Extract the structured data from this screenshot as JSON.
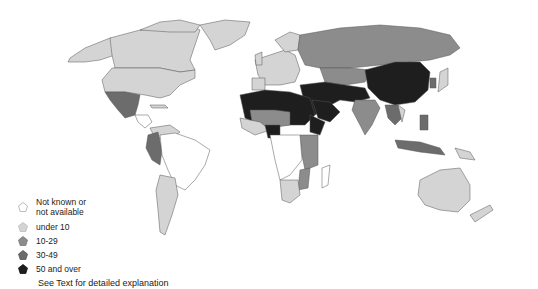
{
  "legend": {
    "items": [
      {
        "label_line1": "Not known or",
        "label_line2": "not available",
        "color": "#ffffff",
        "border": "#aaaaaa"
      },
      {
        "label": "under 10",
        "color": "#d4d4d4",
        "border": "#bbbbbb"
      },
      {
        "label": "10-29",
        "color": "#8c8c8c",
        "border": "#777777"
      },
      {
        "label": "30-49",
        "color": "#6c6c6c",
        "border": "#555555"
      },
      {
        "label": "50 and over",
        "color": "#1e1e1e",
        "border": "#111111"
      }
    ]
  },
  "note": "See Text for detailed explanation",
  "colors": {
    "not_available": "#ffffff",
    "under_10": "#d4d4d4",
    "10_29": "#8c8c8c",
    "30_49": "#6c6c6c",
    "50_over": "#1e1e1e",
    "border": "#555555"
  }
}
